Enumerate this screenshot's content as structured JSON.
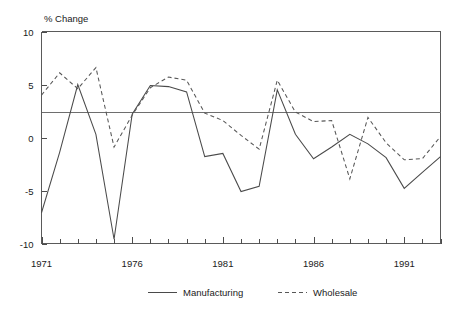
{
  "chart_data": {
    "type": "line",
    "title": "",
    "ylabel": "% Change",
    "xlabel": "",
    "ylim": [
      -10,
      10
    ],
    "yticks": [
      10,
      5,
      0,
      -5,
      -10
    ],
    "ytick_labels": [
      "10",
      "5",
      "0",
      "-5",
      "-10"
    ],
    "xlim": [
      1971,
      1993
    ],
    "xticks": [
      1971,
      1976,
      1981,
      1986,
      1991
    ],
    "xtick_labels": [
      "1971",
      "1976",
      "1981",
      "1986",
      "1991"
    ],
    "minor_xticks": [
      1972,
      1973,
      1974,
      1975,
      1977,
      1978,
      1979,
      1980,
      1982,
      1983,
      1984,
      1985,
      1987,
      1988,
      1989,
      1990,
      1992,
      1993
    ],
    "grid": false,
    "legend_position": "bottom",
    "reference_line": {
      "value": 2.4,
      "orientation": "horizontal",
      "label": ""
    },
    "x": [
      1971,
      1972,
      1973,
      1974,
      1975,
      1976,
      1977,
      1978,
      1979,
      1980,
      1981,
      1982,
      1983,
      1984,
      1985,
      1986,
      1987,
      1988,
      1989,
      1990,
      1991,
      1992,
      1993
    ],
    "series": [
      {
        "name": "Manufacturing",
        "style": "solid",
        "values": [
          -7.1,
          -1.4,
          5.0,
          0.3,
          -9.6,
          2.2,
          4.9,
          4.8,
          4.3,
          -1.8,
          -1.5,
          -5.1,
          -4.6,
          4.5,
          0.3,
          -2.0,
          -0.9,
          0.3,
          -0.6,
          -1.9,
          -4.8,
          -3.3,
          -1.8
        ]
      },
      {
        "name": "Wholesale",
        "style": "dashed",
        "values": [
          4.0,
          6.1,
          4.6,
          6.6,
          -0.9,
          2.1,
          4.7,
          5.7,
          5.4,
          2.3,
          1.6,
          0.2,
          -1.1,
          5.4,
          2.4,
          1.5,
          1.6,
          -3.9,
          1.9,
          -0.5,
          -2.1,
          -2.0,
          0.1
        ]
      }
    ]
  },
  "legend": {
    "entries": [
      {
        "label": "Manufacturing",
        "marker": "solid-line-swatch"
      },
      {
        "label": "Wholesale",
        "marker": "dashed-line-swatch"
      }
    ]
  },
  "colors": {
    "manufacturing_line": "#4a4a4a",
    "wholesale_line": "#575757",
    "axis": "#5a5a5a",
    "reference_line": "#6e6e6e",
    "background": "#ffffff",
    "text": "#1a1a1a"
  }
}
